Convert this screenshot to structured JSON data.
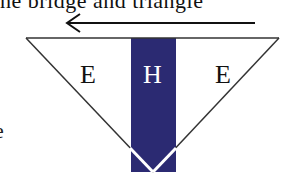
{
  "figure": {
    "top_text_fragment": "he bridge and triangle",
    "side_glyph": "e",
    "arrow": {
      "direction": "left"
    },
    "regions": [
      {
        "id": "left",
        "label": "E"
      },
      {
        "id": "center",
        "label": "H"
      },
      {
        "id": "right",
        "label": "E"
      }
    ],
    "colors": {
      "band": "#2b2a72",
      "outline": "#333333",
      "center_label": "#ffffff",
      "side_label": "#111111"
    }
  }
}
